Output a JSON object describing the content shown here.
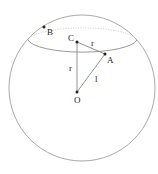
{
  "diagram": {
    "type": "sphere-geometry",
    "sphere": {
      "center_label": "O"
    },
    "points": {
      "B": {
        "label": "B"
      },
      "C": {
        "label": "C"
      },
      "A": {
        "label": "A"
      },
      "O": {
        "label": "O"
      }
    },
    "segments": {
      "CA": {
        "label": "r"
      },
      "CO": {
        "label": "r"
      },
      "OA": {
        "label": "l"
      }
    },
    "colors": {
      "stroke": "#999999",
      "dark": "#222222"
    }
  }
}
